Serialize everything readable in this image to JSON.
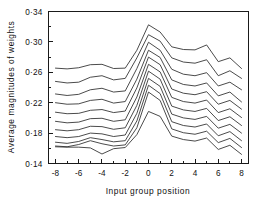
{
  "chart_data": {
    "type": "line",
    "title": "",
    "xlabel": "Input group position",
    "ylabel": "Average magnitudes of weights",
    "x": [
      -8,
      -7,
      -6,
      -5,
      -4,
      -3,
      -2,
      -1,
      0,
      1,
      2,
      3,
      4,
      5,
      6,
      7,
      8
    ],
    "xlim": [
      -8.6,
      8.6
    ],
    "ylim": [
      0.14,
      0.34
    ],
    "xticks": [
      -8,
      -6,
      -4,
      -2,
      0,
      2,
      4,
      6,
      8
    ],
    "xtick_labels": [
      "-8",
      "-6",
      "-4",
      "-2",
      "0",
      "2",
      "4",
      "6",
      "8"
    ],
    "yticks": [
      0.14,
      0.18,
      0.22,
      0.26,
      0.3,
      0.34
    ],
    "ytick_labels": [
      "0·14",
      "0·18",
      "0·22",
      "0·26",
      "0·30",
      "0·34"
    ],
    "minor_xticks": [
      -7,
      -5,
      -3,
      -1,
      1,
      3,
      5,
      7
    ],
    "minor_yticks": [
      0.16,
      0.2,
      0.24,
      0.28,
      0.32
    ],
    "grid": false,
    "legend": "none",
    "line_color": "#2b2b2b",
    "axis_color": "#1a1a1a",
    "background": "#ffffff",
    "series": [
      {
        "name": "curve-1",
        "values": [
          0.2655,
          0.2645,
          0.266,
          0.27,
          0.2705,
          0.265,
          0.2655,
          0.289,
          0.3225,
          0.313,
          0.2935,
          0.29,
          0.2895,
          0.296,
          0.274,
          0.279,
          0.265
        ]
      },
      {
        "name": "curve-2",
        "values": [
          0.248,
          0.246,
          0.247,
          0.2535,
          0.2555,
          0.25,
          0.252,
          0.279,
          0.3095,
          0.301,
          0.279,
          0.2735,
          0.272,
          0.2765,
          0.2555,
          0.262,
          0.252
        ]
      },
      {
        "name": "curve-3",
        "values": [
          0.2315,
          0.2295,
          0.231,
          0.237,
          0.239,
          0.234,
          0.2355,
          0.265,
          0.2995,
          0.289,
          0.264,
          0.2575,
          0.2555,
          0.2595,
          0.242,
          0.247,
          0.237
        ]
      },
      {
        "name": "curve-4",
        "values": [
          0.22,
          0.218,
          0.2185,
          0.223,
          0.2245,
          0.2195,
          0.2215,
          0.251,
          0.289,
          0.2795,
          0.25,
          0.244,
          0.242,
          0.246,
          0.229,
          0.234,
          0.221
        ]
      },
      {
        "name": "curve-5",
        "values": [
          0.2075,
          0.2055,
          0.206,
          0.21,
          0.211,
          0.207,
          0.209,
          0.2395,
          0.28,
          0.27,
          0.238,
          0.2325,
          0.2305,
          0.2345,
          0.218,
          0.223,
          0.2115
        ]
      },
      {
        "name": "curve-6",
        "values": [
          0.1955,
          0.1935,
          0.1945,
          0.199,
          0.1995,
          0.1955,
          0.1975,
          0.2275,
          0.2705,
          0.2605,
          0.227,
          0.2215,
          0.2195,
          0.2235,
          0.207,
          0.212,
          0.2005
        ]
      },
      {
        "name": "curve-7",
        "values": [
          0.1845,
          0.183,
          0.1845,
          0.189,
          0.1885,
          0.185,
          0.187,
          0.2165,
          0.2615,
          0.251,
          0.2155,
          0.2105,
          0.2085,
          0.2125,
          0.1965,
          0.2015,
          0.19
        ]
      },
      {
        "name": "curve-8",
        "values": [
          0.1755,
          0.174,
          0.1755,
          0.18,
          0.179,
          0.1755,
          0.1775,
          0.206,
          0.252,
          0.2415,
          0.205,
          0.2,
          0.198,
          0.202,
          0.1865,
          0.1915,
          0.18
        ]
      },
      {
        "name": "curve-9",
        "values": [
          0.168,
          0.1665,
          0.169,
          0.174,
          0.1715,
          0.1685,
          0.17,
          0.196,
          0.243,
          0.232,
          0.195,
          0.19,
          0.188,
          0.192,
          0.1765,
          0.182,
          0.17
        ]
      },
      {
        "name": "curve-10",
        "values": [
          0.163,
          0.162,
          0.165,
          0.17,
          0.166,
          0.163,
          0.1645,
          0.187,
          0.234,
          0.223,
          0.1855,
          0.1805,
          0.1785,
          0.1825,
          0.1675,
          0.173,
          0.161
        ]
      },
      {
        "name": "curve-11",
        "values": [
          0.162,
          0.1615,
          0.1615,
          0.1605,
          0.1525,
          0.1595,
          0.161,
          0.178,
          0.2085,
          0.202,
          0.176,
          0.1715,
          0.1695,
          0.1735,
          0.1585,
          0.164,
          0.152
        ]
      }
    ]
  }
}
